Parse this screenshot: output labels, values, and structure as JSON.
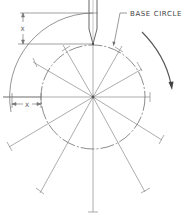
{
  "diagram": {
    "labels": {
      "base_circle": "BASE CIRCLE",
      "rise_dim": "X",
      "transfer_dim": "X"
    },
    "geometry": {
      "center": [
        93,
        97
      ],
      "base_circle_radius": 52,
      "outer_arc_radius": 84,
      "radial_divisions": 12,
      "radial_line_length": 122,
      "rotation": "clockwise"
    },
    "colors": {
      "line": "#7a7a7a",
      "dark_line": "#555555",
      "background": "#ffffff"
    }
  }
}
